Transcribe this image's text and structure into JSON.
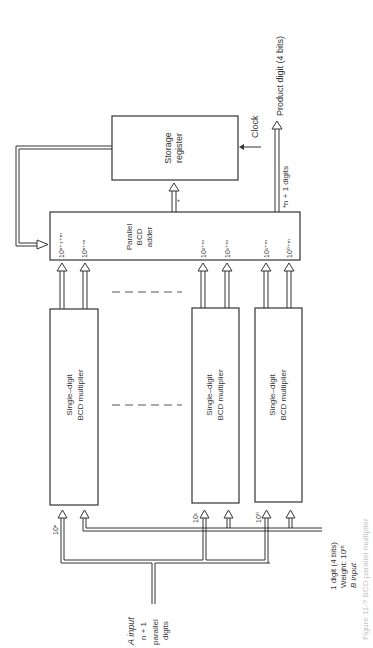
{
  "storage_register": {
    "line1": "Storage",
    "line2": "register"
  },
  "clock": "Clock",
  "product": "Product digit (4 bits)",
  "digits_out": "*n + 1 digits",
  "star": "*",
  "adder": {
    "line1": "Parallel",
    "line2": "BCD",
    "line3": "adder",
    "inputs": [
      "10ⁿ⁺¹⁺ᵐ",
      "10ⁿ⁺ᵐ",
      "10²⁺ᵐ",
      "10¹⁺ᵐ",
      "10¹⁺ᵐ",
      "10⁰⁺ᵐ"
    ]
  },
  "multipliers": [
    {
      "line1": "Single–digit",
      "line2": "BCD multiplier",
      "weight": "10ⁿ"
    },
    {
      "line1": "Single–digit",
      "line2": "BCD multiplier",
      "weight": "10¹"
    },
    {
      "line1": "Single–digit",
      "line2": "BCD multiplier",
      "weight": "10⁰"
    }
  ],
  "a_input": {
    "line1": "A input",
    "line2": "n + 1",
    "line3": "parallel",
    "line4": "digits"
  },
  "b_input": {
    "line1": "1 digit (4 bits)",
    "line2": "Weight: 10ᵐ",
    "line3": "B input"
  },
  "caption": "Figure 11-? BCD parallel multiplier"
}
